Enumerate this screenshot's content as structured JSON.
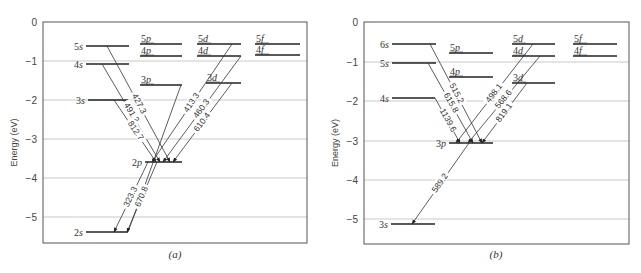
{
  "panels": [
    {
      "id": "a",
      "caption": "(a)",
      "ylabel": "Energy (eV)",
      "frame": {
        "x0": 43,
        "x1": 307,
        "y0": 22,
        "y1": 243
      },
      "yticks": [
        {
          "label": "0",
          "y": 22
        },
        {
          "label": "−1",
          "y": 61
        },
        {
          "label": "−2",
          "y": 100
        },
        {
          "label": "−3",
          "y": 139
        },
        {
          "label": "−4",
          "y": 178
        },
        {
          "label": "−5",
          "y": 217
        }
      ],
      "levels": [
        {
          "name": "5s",
          "x0": 86,
          "x1": 129,
          "y": 46,
          "label_side": "left"
        },
        {
          "name": "4s",
          "x0": 86,
          "x1": 129,
          "y": 64,
          "label_side": "left"
        },
        {
          "name": "3s",
          "x0": 88,
          "x1": 129,
          "y": 100,
          "label_side": "left"
        },
        {
          "name": "2s",
          "x0": 86,
          "x1": 128,
          "y": 232,
          "label_side": "left"
        },
        {
          "name": "5p",
          "x0": 140,
          "x1": 182,
          "y": 44,
          "label_side": "top"
        },
        {
          "name": "4p",
          "x0": 140,
          "x1": 182,
          "y": 56,
          "label_side": "top"
        },
        {
          "name": "3p",
          "x0": 140,
          "x1": 182,
          "y": 85,
          "label_side": "top"
        },
        {
          "name": "2p",
          "x0": 145,
          "x1": 182,
          "y": 162,
          "label_side": "left"
        },
        {
          "name": "5d",
          "x0": 197,
          "x1": 241,
          "y": 44,
          "label_side": "top"
        },
        {
          "name": "4d",
          "x0": 197,
          "x1": 241,
          "y": 56,
          "label_side": "top"
        },
        {
          "name": "3d",
          "x0": 206,
          "x1": 241,
          "y": 83,
          "label_side": "top"
        },
        {
          "name": "5f",
          "x0": 255,
          "x1": 300,
          "y": 44,
          "label_side": "top"
        },
        {
          "name": "4f",
          "x0": 255,
          "x1": 300,
          "y": 55,
          "label_side": "top"
        }
      ],
      "transitions": [
        {
          "from": "5s",
          "to": "2p",
          "wavelength_nm": "427.3",
          "x0": 107,
          "y0": 46,
          "x1": 170,
          "y1": 162
        },
        {
          "from": "4s",
          "to": "2p",
          "wavelength_nm": "491.2",
          "x0": 102,
          "y0": 64,
          "x1": 160,
          "y1": 162
        },
        {
          "from": "3s",
          "to": "2p",
          "wavelength_nm": "812.7",
          "x0": 114,
          "y0": 100,
          "x1": 156,
          "y1": 162
        },
        {
          "from": "5d",
          "to": "2p",
          "wavelength_nm": "413.3",
          "x0": 232,
          "y0": 44,
          "x1": 152,
          "y1": 162
        },
        {
          "from": "4d",
          "to": "2p",
          "wavelength_nm": "460.3",
          "x0": 241,
          "y0": 56,
          "x1": 163,
          "y1": 162
        },
        {
          "from": "3d",
          "to": "2p",
          "wavelength_nm": "610.4",
          "x0": 232,
          "y0": 83,
          "x1": 173,
          "y1": 162
        },
        {
          "from": "3p",
          "to": "2s",
          "wavelength_nm": "670.8",
          "x0": 181,
          "y0": 85,
          "x1": 128,
          "y1": 232,
          "no_arrow": true
        },
        {
          "from": "2p",
          "to": "2s",
          "wavelength_nm": "670.8",
          "x0": 157,
          "y0": 162,
          "x1": 127,
          "y1": 232
        },
        {
          "from": "3p",
          "to": "2s",
          "wavelength_nm": "323.3",
          "x0": 148,
          "y0": 162,
          "x1": 114,
          "y1": 232
        }
      ],
      "caption_pos": {
        "x": 175,
        "y": 258
      }
    },
    {
      "id": "b",
      "caption": "(b)",
      "ylabel": "Energy (eV)",
      "frame": {
        "x0": 364,
        "x1": 629,
        "y0": 22,
        "y1": 244
      },
      "yticks": [
        {
          "label": "0",
          "y": 22
        },
        {
          "label": "−1",
          "y": 62
        },
        {
          "label": "−2",
          "y": 101
        },
        {
          "label": "−3",
          "y": 141
        },
        {
          "label": "−4",
          "y": 180
        },
        {
          "label": "−5",
          "y": 219
        }
      ],
      "levels": [
        {
          "name": "6s",
          "x0": 392,
          "x1": 436,
          "y": 44,
          "label_side": "left"
        },
        {
          "name": "5s",
          "x0": 392,
          "x1": 436,
          "y": 63,
          "label_side": "left"
        },
        {
          "name": "4s",
          "x0": 392,
          "x1": 435,
          "y": 98,
          "label_side": "left"
        },
        {
          "name": "3s",
          "x0": 391,
          "x1": 435,
          "y": 224,
          "label_side": "left"
        },
        {
          "name": "5p",
          "x0": 449,
          "x1": 493,
          "y": 53,
          "label_side": "top"
        },
        {
          "name": "4p",
          "x0": 449,
          "x1": 493,
          "y": 77,
          "label_side": "top"
        },
        {
          "name": "3p",
          "x0": 449,
          "x1": 493,
          "y": 143,
          "label_side": "left"
        },
        {
          "name": "5d",
          "x0": 512,
          "x1": 555,
          "y": 44,
          "label_side": "top"
        },
        {
          "name": "4d",
          "x0": 512,
          "x1": 555,
          "y": 56,
          "label_side": "top"
        },
        {
          "name": "3d",
          "x0": 512,
          "x1": 555,
          "y": 83,
          "label_side": "top"
        },
        {
          "name": "5f",
          "x0": 573,
          "x1": 617,
          "y": 44,
          "label_side": "top"
        },
        {
          "name": "4f",
          "x0": 573,
          "x1": 617,
          "y": 56,
          "label_side": "top"
        }
      ],
      "transitions": [
        {
          "from": "6s",
          "to": "3p",
          "wavelength_nm": "515.2",
          "x0": 430,
          "y0": 44,
          "x1": 482,
          "y1": 143
        },
        {
          "from": "5s",
          "to": "3p",
          "wavelength_nm": "615.8",
          "x0": 428,
          "y0": 63,
          "x1": 473,
          "y1": 143
        },
        {
          "from": "4s",
          "to": "3p",
          "wavelength_nm": "1139.6",
          "x0": 435,
          "y0": 98,
          "x1": 460,
          "y1": 143
        },
        {
          "from": "5d",
          "to": "3p",
          "wavelength_nm": "498.1",
          "x0": 533,
          "y0": 44,
          "x1": 456,
          "y1": 143
        },
        {
          "from": "4d",
          "to": "3p",
          "wavelength_nm": "568.6",
          "x0": 540,
          "y0": 56,
          "x1": 468,
          "y1": 143
        },
        {
          "from": "3d",
          "to": "3p",
          "wavelength_nm": "819.1",
          "x0": 527,
          "y0": 83,
          "x1": 482,
          "y1": 143
        },
        {
          "from": "3p",
          "to": "3s",
          "wavelength_nm": "589.2",
          "x0": 469,
          "y0": 143,
          "x1": 412,
          "y1": 224
        }
      ],
      "caption_pos": {
        "x": 496,
        "y": 258
      }
    }
  ],
  "chart_data": [
    {
      "type": "energy-level-diagram",
      "title": "(a)",
      "ylabel": "Energy (eV)",
      "ylim": [
        -5.6,
        0
      ],
      "yticks": [
        0,
        -1,
        -2,
        -3,
        -4,
        -5
      ],
      "grid": true,
      "columns": [
        "s",
        "p",
        "d",
        "f"
      ],
      "levels_eV": {
        "2s": -5.39,
        "3s": -2.02,
        "4s": -1.05,
        "5s": -0.62,
        "2p": -3.54,
        "3p": -1.56,
        "4p": -0.87,
        "5p": -0.56,
        "3d": -1.51,
        "4d": -0.87,
        "5d": -0.56,
        "4f": -0.85,
        "5f": -0.56
      },
      "transitions_nm": [
        {
          "from": "5s",
          "to": "2p",
          "wavelength": 427.3
        },
        {
          "from": "4s",
          "to": "2p",
          "wavelength": 491.2
        },
        {
          "from": "3s",
          "to": "2p",
          "wavelength": 812.7
        },
        {
          "from": "5d",
          "to": "2p",
          "wavelength": 413.3
        },
        {
          "from": "4d",
          "to": "2p",
          "wavelength": 460.3
        },
        {
          "from": "3d",
          "to": "2p",
          "wavelength": 610.4
        },
        {
          "from": "3p",
          "to": "2s",
          "wavelength": 323.3
        },
        {
          "from": "2p",
          "to": "2s",
          "wavelength": 670.8
        }
      ]
    },
    {
      "type": "energy-level-diagram",
      "title": "(b)",
      "ylabel": "Energy (eV)",
      "ylim": [
        -5.6,
        0
      ],
      "yticks": [
        0,
        -1,
        -2,
        -3,
        -4,
        -5
      ],
      "grid": true,
      "columns": [
        "s",
        "p",
        "d",
        "f"
      ],
      "levels_eV": {
        "3s": -5.14,
        "4s": -1.95,
        "5s": -1.02,
        "6s": -0.56,
        "3p": -3.04,
        "4p": -1.39,
        "5p": -0.79,
        "3d": -1.52,
        "4d": -0.86,
        "5d": -0.56,
        "4f": -0.86,
        "5f": -0.56
      },
      "transitions_nm": [
        {
          "from": "6s",
          "to": "3p",
          "wavelength": 515.2
        },
        {
          "from": "5s",
          "to": "3p",
          "wavelength": 615.8
        },
        {
          "from": "4s",
          "to": "3p",
          "wavelength": 1139.6
        },
        {
          "from": "5d",
          "to": "3p",
          "wavelength": 498.1
        },
        {
          "from": "4d",
          "to": "3p",
          "wavelength": 568.6
        },
        {
          "from": "3d",
          "to": "3p",
          "wavelength": 819.1
        },
        {
          "from": "3p",
          "to": "3s",
          "wavelength": 589.2
        }
      ]
    }
  ]
}
